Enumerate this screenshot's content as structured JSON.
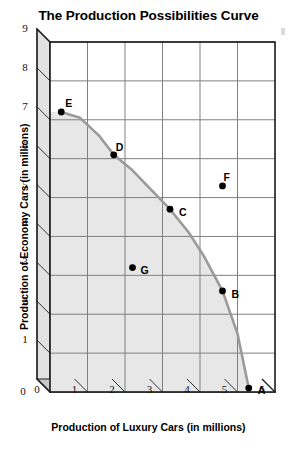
{
  "chart_data": {
    "type": "scatter",
    "title": "The Production Possibilities Curve",
    "xlabel": "Production of Luxury Cars (in millions)",
    "ylabel": "Production of Economy Cars (in millions)",
    "xlim": [
      0,
      6
    ],
    "ylim": [
      0,
      9
    ],
    "xticks": [
      "0",
      "1",
      "2",
      "3",
      "4",
      "5",
      "6"
    ],
    "yticks": [
      "0",
      "1",
      "2",
      "3",
      "4",
      "5",
      "6",
      "7",
      "8",
      "9"
    ],
    "grid": true,
    "legend": "none",
    "style": "3d-box",
    "points": [
      {
        "label": "A",
        "x": 5.3,
        "y": 0.1,
        "on_curve": true,
        "label_dx": 9,
        "label_dy": -4
      },
      {
        "label": "B",
        "x": 4.6,
        "y": 2.6,
        "on_curve": true,
        "label_dx": 9,
        "label_dy": -3
      },
      {
        "label": "C",
        "x": 3.2,
        "y": 4.7,
        "on_curve": true,
        "label_dx": 9,
        "label_dy": -3
      },
      {
        "label": "D",
        "x": 1.7,
        "y": 6.1,
        "on_curve": true,
        "label_dx": 2,
        "label_dy": -14
      },
      {
        "label": "E",
        "x": 0.3,
        "y": 7.2,
        "on_curve": true,
        "label_dx": 4,
        "label_dy": -15
      },
      {
        "label": "F",
        "x": 4.6,
        "y": 5.3,
        "on_curve": false,
        "label_dx": 1,
        "label_dy": -15
      },
      {
        "label": "G",
        "x": 2.2,
        "y": 3.2,
        "on_curve": false,
        "label_dx": 8,
        "label_dy": -4
      }
    ],
    "curve": {
      "name": "production possibilities frontier",
      "from": "E",
      "to": "A",
      "x": [
        0.3,
        0.8,
        1.3,
        1.7,
        2.2,
        2.7,
        3.2,
        3.7,
        4.1,
        4.6,
        5.0,
        5.3
      ],
      "y": [
        7.2,
        7.05,
        6.6,
        6.1,
        5.7,
        5.2,
        4.7,
        4.1,
        3.5,
        2.6,
        1.5,
        0.1
      ],
      "shaded_region": "feasible production set (under the curve)"
    },
    "colors": {
      "curve": "#9a9a9a",
      "shaded_fill": "#e7e7e7",
      "grid": "#808080",
      "axis": "#1a1a1a",
      "point": "#000000",
      "background": "#ffffff",
      "base_3d": "#c9c9c9",
      "side_3d": "#e2e2e2"
    }
  }
}
